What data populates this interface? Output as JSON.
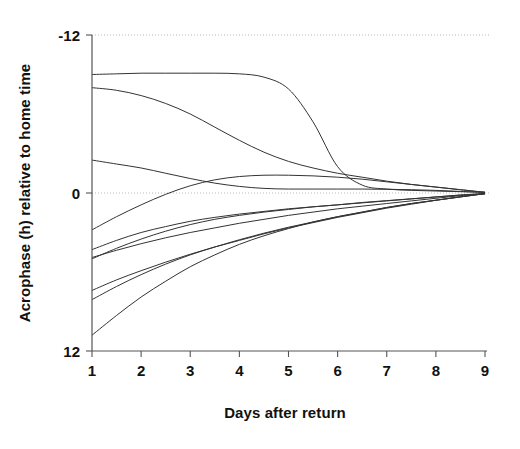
{
  "chart_data": {
    "type": "line",
    "title": "",
    "subtitle": "",
    "xlabel": "Days after return",
    "ylabel": "Acrophase (h) relative to home time",
    "xlim": [
      1,
      9
    ],
    "ylim": [
      12,
      -12
    ],
    "y_inverted": true,
    "xticks": [
      "1",
      "2",
      "3",
      "4",
      "5",
      "6",
      "7",
      "8",
      "9"
    ],
    "xtick_values": [
      1,
      2,
      3,
      4,
      5,
      6,
      7,
      8,
      9
    ],
    "yticks": [
      "-12",
      "0",
      "12"
    ],
    "ytick_values": [
      -12,
      0,
      12
    ],
    "grid": "horizontal-dotted-at-yticks",
    "legend": "none",
    "annotations": [],
    "line_color": "#333333",
    "grid_color": "#b9b9b9",
    "axis_color": "#555555",
    "x": [
      1,
      1.5,
      2,
      2.5,
      3,
      3.5,
      4,
      4.5,
      5,
      5.5,
      6,
      6.5,
      7,
      7.5,
      8,
      8.5,
      9
    ],
    "series": [
      {
        "name": "subject-1",
        "values": [
          -9.0,
          -9.05,
          -9.1,
          -9.1,
          -9.1,
          -9.1,
          -9.05,
          -8.8,
          -7.9,
          -5.4,
          -2.0,
          -0.6,
          -0.3,
          -0.2,
          -0.15,
          -0.1,
          -0.05
        ]
      },
      {
        "name": "subject-2",
        "values": [
          -8.0,
          -7.8,
          -7.4,
          -6.8,
          -6.0,
          -5.0,
          -4.0,
          -3.1,
          -2.4,
          -1.9,
          -1.5,
          -1.2,
          -0.9,
          -0.65,
          -0.45,
          -0.25,
          -0.05
        ]
      },
      {
        "name": "subject-3",
        "values": [
          -2.5,
          -2.2,
          -1.9,
          -1.5,
          -1.1,
          -0.75,
          -0.5,
          -0.35,
          -0.3,
          -0.3,
          -0.3,
          -0.3,
          -0.28,
          -0.25,
          -0.2,
          -0.12,
          -0.05
        ]
      },
      {
        "name": "subject-4",
        "values": [
          2.8,
          1.8,
          0.9,
          0.1,
          -0.55,
          -1.0,
          -1.25,
          -1.35,
          -1.35,
          -1.3,
          -1.2,
          -1.05,
          -0.85,
          -0.65,
          -0.45,
          -0.25,
          -0.05
        ]
      },
      {
        "name": "subject-5",
        "values": [
          4.3,
          3.6,
          3.0,
          2.55,
          2.15,
          1.85,
          1.6,
          1.4,
          1.2,
          1.05,
          0.9,
          0.75,
          0.6,
          0.45,
          0.3,
          0.15,
          0.05
        ]
      },
      {
        "name": "subject-6",
        "values": [
          4.9,
          4.35,
          3.85,
          3.4,
          3.0,
          2.65,
          2.3,
          2.0,
          1.7,
          1.45,
          1.2,
          1.0,
          0.8,
          0.6,
          0.4,
          0.2,
          0.05
        ]
      },
      {
        "name": "subject-7",
        "values": [
          5.0,
          4.2,
          3.5,
          2.9,
          2.4,
          2.0,
          1.7,
          1.45,
          1.25,
          1.05,
          0.9,
          0.72,
          0.58,
          0.44,
          0.3,
          0.16,
          0.05
        ]
      },
      {
        "name": "subject-8",
        "values": [
          7.4,
          6.6,
          5.9,
          5.25,
          4.65,
          4.1,
          3.6,
          3.1,
          2.65,
          2.25,
          1.85,
          1.5,
          1.15,
          0.85,
          0.55,
          0.28,
          0.05
        ]
      },
      {
        "name": "subject-9",
        "values": [
          8.1,
          7.1,
          6.2,
          5.4,
          4.7,
          4.1,
          3.55,
          3.05,
          2.6,
          2.2,
          1.8,
          1.45,
          1.1,
          0.8,
          0.55,
          0.3,
          0.05
        ]
      },
      {
        "name": "subject-10",
        "values": [
          10.8,
          9.3,
          7.9,
          6.7,
          5.6,
          4.7,
          3.9,
          3.25,
          2.7,
          2.2,
          1.8,
          1.45,
          1.1,
          0.8,
          0.55,
          0.3,
          0.05
        ]
      }
    ]
  }
}
